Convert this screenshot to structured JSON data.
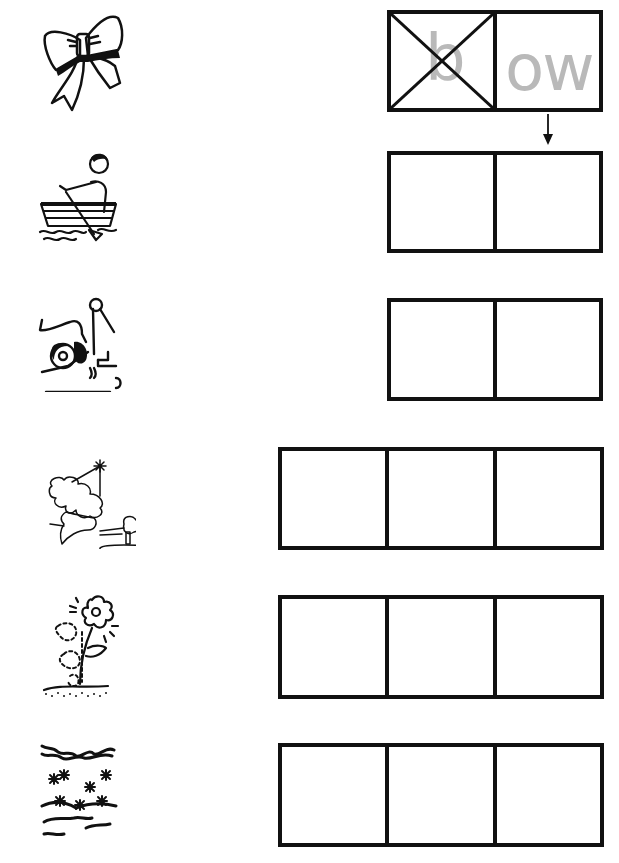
{
  "worksheet": {
    "rows": [
      {
        "picture": "bow-icon",
        "word": "bow",
        "boxes": 2,
        "example": true,
        "cells": [
          {
            "text": "b",
            "crossed_out": true
          },
          {
            "text": "ow",
            "crossed_out": false
          }
        ]
      },
      {
        "picture": "boy-rowing-boat-icon",
        "word": "row",
        "boxes": 2,
        "cells": [
          {
            "text": ""
          },
          {
            "text": ""
          }
        ]
      },
      {
        "picture": "tow-truck-icon",
        "word": "tow",
        "boxes": 2,
        "cells": [
          {
            "text": ""
          },
          {
            "text": ""
          }
        ]
      },
      {
        "picture": "blowing-candle-icon",
        "word": "blow",
        "boxes": 3,
        "cells": [
          {
            "text": ""
          },
          {
            "text": ""
          },
          {
            "text": ""
          }
        ]
      },
      {
        "picture": "growing-flower-icon",
        "word": "grow",
        "boxes": 3,
        "cells": [
          {
            "text": ""
          },
          {
            "text": ""
          },
          {
            "text": ""
          }
        ]
      },
      {
        "picture": "snow-icon",
        "word": "snow",
        "boxes": 3,
        "cells": [
          {
            "text": ""
          },
          {
            "text": ""
          },
          {
            "text": ""
          }
        ]
      }
    ],
    "example_arrow": "down-arrow-icon",
    "colors": {
      "ink": "#111111",
      "sample_text": "#b9b9b9",
      "background": "#ffffff"
    }
  }
}
